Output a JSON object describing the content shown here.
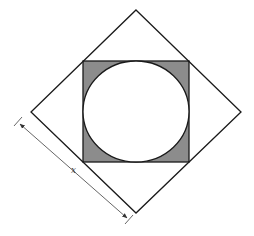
{
  "diagram": {
    "dimension_label": "x",
    "colors": {
      "stroke": "#1a1a1a",
      "shade": "#8c8c8c",
      "background": "#ffffff",
      "dimension_line": "#555555"
    },
    "outer_diamond": {
      "top": [
        136,
        10
      ],
      "right": [
        241,
        112
      ],
      "bottom": [
        136,
        213
      ],
      "left": [
        31,
        112
      ]
    },
    "inner_square": {
      "x": 83,
      "y": 61,
      "width": 106,
      "height": 101
    },
    "circle": {
      "cx": 136,
      "cy": 111.5,
      "rx": 53,
      "ry": 50.5
    },
    "dimension_line": {
      "start": [
        18,
        122
      ],
      "end": [
        129,
        220
      ],
      "label_position": [
        72,
        170
      ]
    }
  }
}
